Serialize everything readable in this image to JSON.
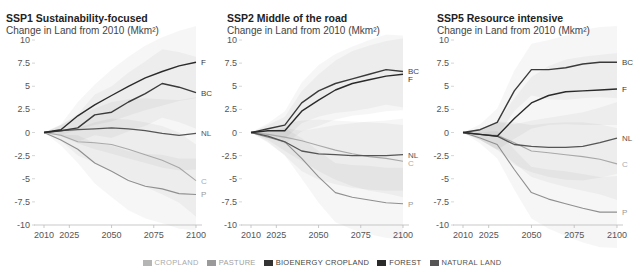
{
  "panels": [
    {
      "title": "SSP1 Sustainability-focused",
      "subtitle": "Change in Land from 2010 (Mkm²)"
    },
    {
      "title": "SSP2 Middle of the road",
      "subtitle": "Change in Land from 2010 (Mkm²)"
    },
    {
      "title": "SSP5 Resource intensive",
      "subtitle": "Change in Land from 2010 (Mkm²)"
    }
  ],
  "legend": [
    {
      "label": "CROPLAND",
      "color": "#b5b5b5",
      "text_color": "#aaaaaa"
    },
    {
      "label": "PASTURE",
      "color": "#9a9a9a",
      "text_color": "#a0a0a0"
    },
    {
      "label": "BIOENERGY CROPLAND",
      "color": "#333333",
      "text_color": "#444444"
    },
    {
      "label": "FOREST",
      "color": "#2a2a2a",
      "text_color": "#444444"
    },
    {
      "label": "NATURAL LAND",
      "color": "#555555",
      "text_color": "#555555"
    }
  ],
  "chart_data": [
    {
      "type": "line",
      "title": "SSP1 Sustainability-focused",
      "ylabel": "Change in Land from 2010 (Mkm²)",
      "xlabel": "",
      "x": [
        2010,
        2020,
        2030,
        2040,
        2050,
        2060,
        2070,
        2080,
        2090,
        2100
      ],
      "xticks": [
        2010,
        2025,
        2050,
        2075,
        2100
      ],
      "yticks": [
        10,
        7.5,
        5,
        2.5,
        0,
        -2.5,
        -5,
        -7.5,
        -10
      ],
      "ylim": [
        -10,
        10
      ],
      "grid": false,
      "series": [
        {
          "name": "Forest",
          "label": "F",
          "values": [
            0,
            0.3,
            1.8,
            3.0,
            4.0,
            5.0,
            5.9,
            6.6,
            7.2,
            7.6
          ]
        },
        {
          "name": "Bioenergy cropland",
          "label": "BC",
          "values": [
            0,
            0.2,
            0.5,
            1.9,
            2.2,
            3.3,
            4.2,
            5.3,
            4.9,
            4.3
          ]
        },
        {
          "name": "Natural land",
          "label": "NL",
          "values": [
            0,
            0.2,
            0.3,
            0.4,
            0.5,
            0.4,
            0.2,
            -0.1,
            -0.3,
            -0.1
          ]
        },
        {
          "name": "Cropland",
          "label": "C",
          "values": [
            0,
            -0.3,
            -1.0,
            -1.1,
            -1.3,
            -1.8,
            -2.4,
            -3.0,
            -3.8,
            -5.2
          ]
        },
        {
          "name": "Pasture",
          "label": "P",
          "values": [
            0,
            -0.8,
            -1.8,
            -3.3,
            -4.2,
            -5.2,
            -5.8,
            -6.1,
            -6.6,
            -6.7
          ]
        }
      ]
    },
    {
      "type": "line",
      "title": "SSP2 Middle of the road",
      "ylabel": "Change in Land from 2010 (Mkm²)",
      "xlabel": "",
      "x": [
        2010,
        2020,
        2030,
        2040,
        2050,
        2060,
        2070,
        2080,
        2090,
        2100
      ],
      "xticks": [
        2010,
        2025,
        2050,
        2075,
        2100
      ],
      "yticks": [
        10,
        7.5,
        5,
        2.5,
        0,
        -2.5,
        -5,
        -7.5,
        -10
      ],
      "ylim": [
        -10,
        10
      ],
      "grid": false,
      "series": [
        {
          "name": "Bioenergy cropland",
          "label": "BC",
          "values": [
            0,
            0.4,
            0.8,
            3.2,
            4.5,
            5.3,
            5.8,
            6.3,
            6.8,
            6.6
          ]
        },
        {
          "name": "Forest",
          "label": "F",
          "values": [
            0,
            0.2,
            0.2,
            2.3,
            3.5,
            4.6,
            5.3,
            5.7,
            6.1,
            6.3
          ]
        },
        {
          "name": "Natural land",
          "label": "NL",
          "values": [
            0,
            -0.4,
            -1.0,
            -2.0,
            -2.3,
            -2.4,
            -2.5,
            -2.5,
            -2.5,
            -2.4
          ]
        },
        {
          "name": "Cropland",
          "label": "C",
          "values": [
            0,
            -0.2,
            -0.5,
            -0.9,
            -1.4,
            -1.9,
            -2.3,
            -2.6,
            -2.8,
            -3.1
          ]
        },
        {
          "name": "Pasture",
          "label": "P",
          "values": [
            0,
            -0.5,
            -1.0,
            -2.8,
            -4.8,
            -6.5,
            -7.0,
            -7.3,
            -7.6,
            -7.7
          ]
        }
      ]
    },
    {
      "type": "line",
      "title": "SSP5 Resource intensive",
      "ylabel": "Change in Land from 2010 (Mkm²)",
      "xlabel": "",
      "x": [
        2010,
        2020,
        2030,
        2040,
        2050,
        2060,
        2070,
        2080,
        2090,
        2100
      ],
      "xticks": [
        2010,
        2025,
        2050,
        2075,
        2100
      ],
      "yticks": [
        10,
        7.5,
        5,
        2.5,
        0,
        -2.5,
        -5,
        -7.5,
        -10
      ],
      "ylim": [
        -10,
        10
      ],
      "grid": false,
      "series": [
        {
          "name": "Bioenergy cropland",
          "label": "BC",
          "values": [
            0,
            0.3,
            1.1,
            4.5,
            6.8,
            6.8,
            7.0,
            7.4,
            7.6,
            7.6
          ]
        },
        {
          "name": "Forest",
          "label": "F",
          "values": [
            0,
            -0.2,
            -0.4,
            1.5,
            3.2,
            4.0,
            4.4,
            4.5,
            4.6,
            4.7
          ]
        },
        {
          "name": "Natural land",
          "label": "NL",
          "values": [
            0,
            -0.2,
            -0.4,
            -1.3,
            -1.5,
            -1.6,
            -1.6,
            -1.5,
            -1.1,
            -0.6
          ]
        },
        {
          "name": "Cropland",
          "label": "C",
          "values": [
            0,
            -0.2,
            -0.3,
            -1.1,
            -2.0,
            -2.2,
            -2.4,
            -2.6,
            -2.9,
            -3.4
          ]
        },
        {
          "name": "Pasture",
          "label": "P",
          "values": [
            0,
            -0.6,
            -1.3,
            -4.0,
            -6.5,
            -7.2,
            -7.7,
            -8.2,
            -8.6,
            -8.6
          ]
        }
      ]
    }
  ]
}
